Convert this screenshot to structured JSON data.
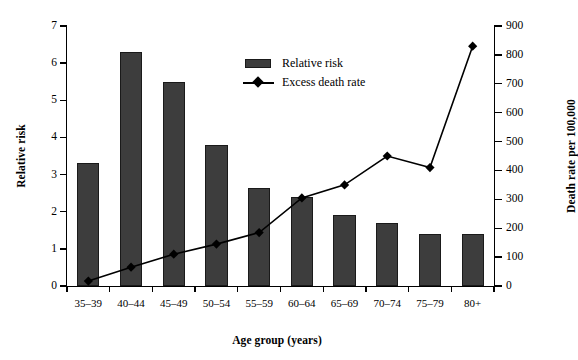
{
  "chart_data": {
    "type": "bar",
    "title": "",
    "xlabel": "Age group (years)",
    "ylabel": "Relative risk",
    "y2label": "Death rate per 100,000",
    "categories": [
      "35–39",
      "40–44",
      "45–49",
      "50–54",
      "55–59",
      "60–64",
      "65–69",
      "70–74",
      "75–79",
      "80+"
    ],
    "ylim": [
      0,
      7
    ],
    "y2lim": [
      0,
      900
    ],
    "yticks": [
      "0",
      "1",
      "2",
      "3",
      "4",
      "5",
      "6",
      "7"
    ],
    "y2ticks": [
      "0",
      "100",
      "200",
      "300",
      "400",
      "500",
      "600",
      "700",
      "800",
      "900"
    ],
    "grid": false,
    "legend_position": "upper center",
    "series": [
      {
        "name": "Relative risk",
        "kind": "bar",
        "axis": "left",
        "color": "#3d3d3d",
        "values": [
          3.3,
          6.3,
          5.5,
          3.8,
          2.65,
          2.4,
          1.9,
          1.7,
          1.4,
          1.4
        ]
      },
      {
        "name": "Excess death rate",
        "kind": "line",
        "axis": "right",
        "color": "#000000",
        "marker": "diamond",
        "values": [
          17,
          65,
          110,
          145,
          185,
          305,
          350,
          450,
          410,
          830
        ]
      }
    ]
  },
  "legend": {
    "items": [
      {
        "label": "Relative risk",
        "key": "bar-swatch"
      },
      {
        "label": "Excess death rate",
        "key": "line-diamond-marker"
      }
    ]
  }
}
